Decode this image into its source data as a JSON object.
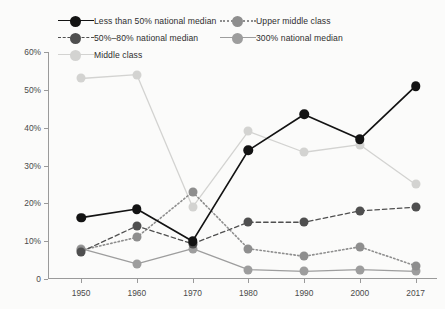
{
  "chart_data": {
    "type": "line",
    "title": "",
    "xlabel": "",
    "ylabel": "",
    "x": [
      "1950",
      "1960",
      "1970",
      "1980",
      "1990",
      "2000",
      "2017"
    ],
    "categories": [
      "1950",
      "1960",
      "1970",
      "1980",
      "1990",
      "2000",
      "2017"
    ],
    "ylim": [
      0,
      60
    ],
    "yticks": [
      0,
      10,
      20,
      30,
      40,
      50,
      60
    ],
    "ytick_labels": [
      "0",
      "10%",
      "20%",
      "30%",
      "40%",
      "50%",
      "60%"
    ],
    "grid": false,
    "legend_position": "top",
    "series": [
      {
        "name": "Less than 50% national median",
        "color": "#131313",
        "line_style": "solid",
        "values": [
          16.2,
          18.5,
          10.0,
          34.0,
          43.5,
          37.0,
          51.0
        ]
      },
      {
        "name": "50%–80% national median",
        "color": "#4f4f4f",
        "line_style": "dashed",
        "values": [
          7.2,
          14.0,
          9.3,
          15.0,
          15.0,
          18.0,
          19.0
        ]
      },
      {
        "name": "Middle class",
        "color": "#d3d3d1",
        "line_style": "solid",
        "values": [
          53.0,
          54.0,
          19.0,
          39.0,
          33.5,
          35.5,
          25.0
        ]
      },
      {
        "name": "Upper middle class",
        "color": "#8e8e8e",
        "line_style": "dotted",
        "values": [
          7.6,
          11.0,
          23.0,
          8.0,
          6.0,
          8.5,
          3.5
        ]
      },
      {
        "name": "300% national median",
        "color": "#9d9d9d",
        "line_style": "solid",
        "values": [
          8.0,
          4.0,
          8.0,
          2.5,
          2.0,
          2.5,
          2.0
        ]
      }
    ]
  }
}
